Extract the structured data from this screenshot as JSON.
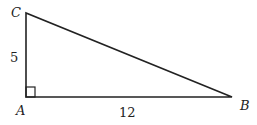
{
  "diagram": {
    "type": "right-triangle",
    "vertices": {
      "A": {
        "label": "A",
        "right_angle": true
      },
      "B": {
        "label": "B"
      },
      "C": {
        "label": "C"
      }
    },
    "sides": {
      "AC": {
        "label": "5"
      },
      "AB": {
        "label": "12"
      },
      "BC": {
        "label": ""
      }
    },
    "colors": {
      "stroke": "#222222",
      "background": "#ffffff"
    }
  }
}
